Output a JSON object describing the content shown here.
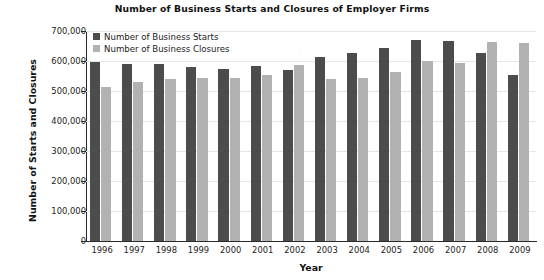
{
  "chart_data": {
    "type": "bar",
    "title": "Number of Business Starts and Closures of Employer Firms",
    "xlabel": "Year",
    "ylabel": "Number of Starts and Closures",
    "categories": [
      "1996",
      "1997",
      "1998",
      "1999",
      "2000",
      "2001",
      "2002",
      "2003",
      "2004",
      "2005",
      "2006",
      "2007",
      "2008",
      "2009"
    ],
    "series": [
      {
        "name": "Number of Business Starts",
        "color": "#4c4c4c",
        "values": [
          597000,
          590000,
          590000,
          580000,
          574000,
          585000,
          570000,
          612000,
          628000,
          644000,
          670000,
          668000,
          626000,
          552000
        ]
      },
      {
        "name": "Number of Business Closures",
        "color": "#b2b2b2",
        "values": [
          512000,
          530000,
          540000,
          544000,
          542000,
          553000,
          587000,
          541000,
          542000,
          565000,
          599000,
          592000,
          663000,
          660000
        ]
      }
    ],
    "ylim": [
      0,
      700000
    ],
    "yticks": [
      "0",
      "100,000",
      "200,000",
      "300,000",
      "400,000",
      "500,000",
      "600,000",
      "700,000"
    ],
    "ytick_values": [
      0,
      100000,
      200000,
      300000,
      400000,
      500000,
      600000,
      700000
    ],
    "grid": true,
    "legend_position": "top-left-inside"
  }
}
